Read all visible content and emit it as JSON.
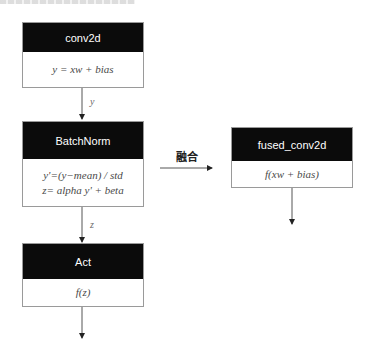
{
  "diagram": {
    "nodes": [
      {
        "id": "conv2d",
        "title": "conv2d",
        "lines": [
          "y = xw + bias"
        ]
      },
      {
        "id": "batchnorm",
        "title": "BatchNorm",
        "lines": [
          "y'=(y−mean) / std",
          "z= alpha y' + beta"
        ]
      },
      {
        "id": "act",
        "title": "Act",
        "lines": [
          "f(z)"
        ]
      },
      {
        "id": "fused_conv2d",
        "title": "fused_conv2d",
        "lines": [
          "f(xw + bias)"
        ]
      }
    ],
    "edges": [
      {
        "from": "conv2d",
        "to": "batchnorm",
        "label": "y"
      },
      {
        "from": "batchnorm",
        "to": "act",
        "label": "z"
      },
      {
        "from": "act",
        "to": "output",
        "label": ""
      },
      {
        "from": "unfused_chain",
        "to": "fused_conv2d",
        "label": "融合"
      },
      {
        "from": "fused_conv2d",
        "to": "output",
        "label": ""
      }
    ],
    "colors": {
      "header_bg": "#0b0b0b",
      "header_text": "#ffffff",
      "border": "#9a9a9a",
      "edge": "#555555"
    }
  }
}
